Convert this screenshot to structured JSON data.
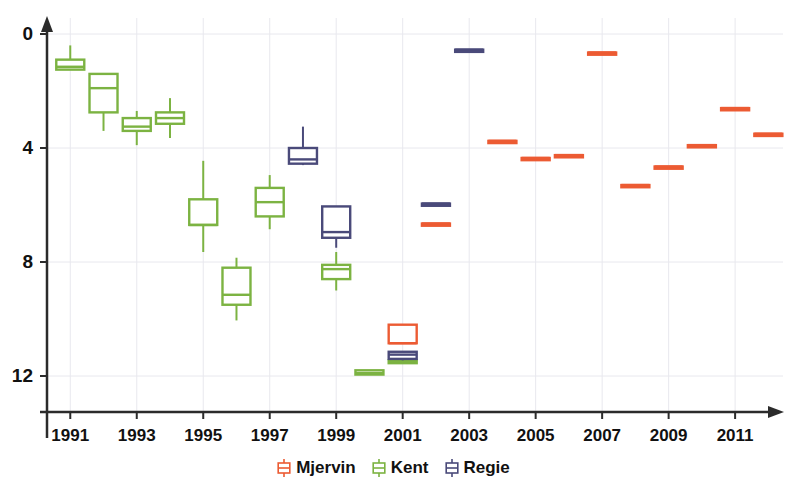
{
  "chart_data": {
    "type": "box",
    "title": "",
    "xlabel": "",
    "ylabel": "",
    "xlim": [
      1990.3,
      2012.2
    ],
    "ylim": [
      -1.2,
      12.9
    ],
    "yticks": [
      0,
      4,
      8,
      12
    ],
    "xticks": [
      1991,
      1993,
      1995,
      1997,
      1999,
      2001,
      2003,
      2005,
      2007,
      2009,
      2011
    ],
    "grid": true,
    "legend_position": "bottom-center",
    "series": [
      {
        "name": "Mjervin",
        "color": "#ec5b33",
        "boxes": [
          {
            "x": 2001,
            "whisker_low": 1.15,
            "q1": 1.15,
            "median": 1.15,
            "q3": 1.8,
            "whisker_high": 1.8
          },
          {
            "x": 2002,
            "whisker_low": 5.35,
            "q1": 5.35,
            "median": 5.35,
            "q3": 5.35,
            "whisker_high": 5.35
          },
          {
            "x": 2004,
            "whisker_low": 8.25,
            "q1": 8.25,
            "median": 8.25,
            "q3": 8.25,
            "whisker_high": 8.25
          },
          {
            "x": 2005,
            "whisker_low": 7.65,
            "q1": 7.65,
            "median": 7.65,
            "q3": 7.65,
            "whisker_high": 7.65
          },
          {
            "x": 2006,
            "whisker_low": 7.75,
            "q1": 7.75,
            "median": 7.75,
            "q3": 7.75,
            "whisker_high": 7.75
          },
          {
            "x": 2007,
            "whisker_low": 11.35,
            "q1": 11.35,
            "median": 11.35,
            "q3": 11.35,
            "whisker_high": 11.35
          },
          {
            "x": 2008,
            "whisker_low": 6.7,
            "q1": 6.7,
            "median": 6.7,
            "q3": 6.7,
            "whisker_high": 6.7
          },
          {
            "x": 2009,
            "whisker_low": 7.35,
            "q1": 7.35,
            "median": 7.35,
            "q3": 7.35,
            "whisker_high": 7.35
          },
          {
            "x": 2010,
            "whisker_low": 8.1,
            "q1": 8.1,
            "median": 8.1,
            "q3": 8.1,
            "whisker_high": 8.1
          },
          {
            "x": 2011,
            "whisker_low": 9.4,
            "q1": 9.4,
            "median": 9.4,
            "q3": 9.4,
            "whisker_high": 9.4
          },
          {
            "x": 2012,
            "whisker_low": 8.5,
            "q1": 8.5,
            "median": 8.5,
            "q3": 8.5,
            "whisker_high": 8.5
          }
        ]
      },
      {
        "name": "Kent",
        "color": "#7cb342",
        "boxes": [
          {
            "x": 1991,
            "whisker_low": 10.75,
            "q1": 10.75,
            "median": 10.85,
            "q3": 11.1,
            "whisker_high": 11.6
          },
          {
            "x": 1992,
            "whisker_low": 8.6,
            "q1": 9.25,
            "median": 10.1,
            "q3": 10.6,
            "whisker_high": 10.6
          },
          {
            "x": 1993,
            "whisker_low": 8.1,
            "q1": 8.6,
            "median": 8.75,
            "q3": 9.05,
            "whisker_high": 9.3
          },
          {
            "x": 1994,
            "whisker_low": 8.35,
            "q1": 8.85,
            "median": 9.05,
            "q3": 9.25,
            "whisker_high": 9.75
          },
          {
            "x": 1995,
            "whisker_low": 4.35,
            "q1": 5.3,
            "median": 5.3,
            "q3": 6.2,
            "whisker_high": 7.55
          },
          {
            "x": 1996,
            "whisker_low": 1.95,
            "q1": 2.5,
            "median": 2.85,
            "q3": 3.8,
            "whisker_high": 4.15
          },
          {
            "x": 1997,
            "whisker_low": 5.15,
            "q1": 5.6,
            "median": 6.1,
            "q3": 6.6,
            "whisker_high": 7.05
          },
          {
            "x": 1999,
            "whisker_low": 3.0,
            "q1": 3.4,
            "median": 3.75,
            "q3": 3.9,
            "whisker_high": 4.35
          },
          {
            "x": 2000,
            "whisker_low": 0.05,
            "q1": 0.05,
            "median": 0.1,
            "q3": 0.2,
            "whisker_high": 0.2
          },
          {
            "x": 2001,
            "whisker_low": 0.45,
            "q1": 0.45,
            "median": 0.5,
            "q3": 0.55,
            "whisker_high": 0.55
          }
        ]
      },
      {
        "name": "Regie",
        "color": "#4a4a7a",
        "boxes": [
          {
            "x": 1998,
            "whisker_low": 7.4,
            "q1": 7.45,
            "median": 7.6,
            "q3": 8.0,
            "whisker_high": 8.75
          },
          {
            "x": 1999,
            "whisker_low": 4.5,
            "q1": 4.85,
            "median": 5.05,
            "q3": 5.95,
            "whisker_high": 5.95
          },
          {
            "x": 2001,
            "whisker_low": 0.55,
            "q1": 0.6,
            "median": 0.75,
            "q3": 0.85,
            "whisker_high": 0.85
          },
          {
            "x": 2002,
            "whisker_low": 6.05,
            "q1": 6.05,
            "median": 6.05,
            "q3": 6.05,
            "whisker_high": 6.05
          },
          {
            "x": 2003,
            "whisker_low": 11.45,
            "q1": 11.45,
            "median": 11.45,
            "q3": 11.45,
            "whisker_high": 11.45
          }
        ]
      }
    ]
  },
  "axes": {
    "y_tick_labels": [
      "12",
      "8",
      "4",
      "0"
    ],
    "x_tick_labels": [
      "1991",
      "1993",
      "1995",
      "1997",
      "1999",
      "2001",
      "2003",
      "2005",
      "2007",
      "2009",
      "2011"
    ]
  },
  "legend": {
    "items": [
      {
        "label": "Mjervin",
        "color": "#ec5b33",
        "glyph": "boxplot-glyph"
      },
      {
        "label": "Kent",
        "color": "#7cb342",
        "glyph": "boxplot-glyph"
      },
      {
        "label": "Regie",
        "color": "#4a4a7a",
        "glyph": "boxplot-glyph"
      }
    ]
  },
  "colors": {
    "axis": "#2b2b2b",
    "grid": "#e8e8ee",
    "background": "#ffffff",
    "text": "#111111"
  }
}
